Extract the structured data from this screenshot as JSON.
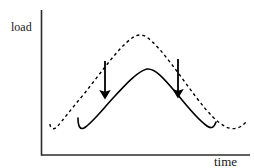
{
  "figure": {
    "title": "",
    "background_color": "#ffffff",
    "ink_color": "#000000",
    "width": 254,
    "height": 168
  },
  "axes": {
    "y_label": "load",
    "x_label": "time",
    "y_axis_line": {
      "x": 41,
      "y_top": 10,
      "y_bottom": 155
    },
    "x_axis_line": {
      "y": 155,
      "x_left": 41,
      "x_right": 250
    },
    "ticks": [],
    "grid": false
  },
  "annotations": {
    "arrows": [
      {
        "name": "left-down-arrow",
        "x": 105,
        "y_start": 61,
        "y_end": 94,
        "direction": "down"
      },
      {
        "name": "right-down-arrow",
        "x": 178,
        "y_start": 59,
        "y_end": 93,
        "direction": "down"
      }
    ]
  },
  "chart_data": {
    "type": "line",
    "title": "",
    "xlabel": "time",
    "ylabel": "load",
    "xlim": [
      41,
      250
    ],
    "ylim": [
      155,
      10
    ],
    "grid": false,
    "legend": null,
    "axis_ticks": {
      "x": [],
      "y": []
    },
    "series": [
      {
        "name": "unshaped load",
        "style": "dashed",
        "color": "#000000",
        "dash_pattern": "3,3",
        "width": 1.4,
        "path": "M 50 124 C 50 129, 54 130, 57 127 C 63 120, 72 108, 84 94 C 100 74, 118 48, 132 38 C 137 34, 143 34, 148 38 C 162 49, 180 76, 196 97 C 208 113, 218 123, 226 127 C 233 130, 240 129, 246 122",
        "points": [
          {
            "x": 50,
            "y": 124
          },
          {
            "x": 57,
            "y": 127
          },
          {
            "x": 84,
            "y": 94
          },
          {
            "x": 140,
            "y": 34
          },
          {
            "x": 196,
            "y": 97
          },
          {
            "x": 226,
            "y": 127
          },
          {
            "x": 246,
            "y": 122
          }
        ]
      },
      {
        "name": "shaped load",
        "style": "solid",
        "color": "#000000",
        "width": 1.6,
        "path": "M 78 118 C 78 126, 80 130, 84 128 C 92 123, 102 110, 114 97 C 126 84, 138 71, 147 69 C 156 68, 166 81, 178 95 C 190 110, 200 121, 207 126 C 211 129, 214 128, 216 122",
        "points": [
          {
            "x": 78,
            "y": 118
          },
          {
            "x": 84,
            "y": 128
          },
          {
            "x": 114,
            "y": 97
          },
          {
            "x": 147,
            "y": 69
          },
          {
            "x": 178,
            "y": 95
          },
          {
            "x": 207,
            "y": 126
          },
          {
            "x": 216,
            "y": 122
          }
        ]
      }
    ]
  }
}
